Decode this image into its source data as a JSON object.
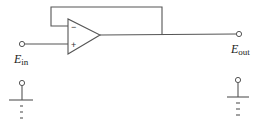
{
  "diagram": {
    "type": "op-amp voltage follower circuit",
    "opamp": {
      "inverting_label": "−",
      "noninverting_label": "+"
    },
    "input": {
      "label_main": "E",
      "label_sub": "in"
    },
    "output": {
      "label_main": "E",
      "label_sub": "out"
    },
    "colors": {
      "wire": "#555555",
      "background": "#ffffff"
    }
  }
}
